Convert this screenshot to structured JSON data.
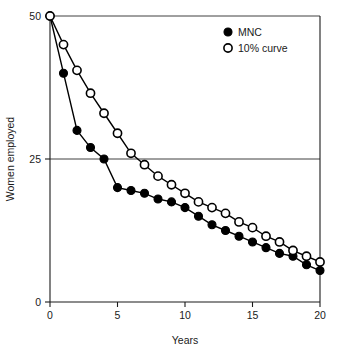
{
  "chart_data": {
    "type": "line",
    "title": "",
    "subtitle": "",
    "xlabel": "Years",
    "ylabel": "Women employed",
    "xlim": [
      0,
      20
    ],
    "ylim": [
      0,
      50
    ],
    "xticks": [
      0,
      5,
      10,
      15,
      20
    ],
    "yticks": [
      0,
      25,
      50
    ],
    "xtick_labels": [
      "0",
      "5",
      "10",
      "15",
      "20"
    ],
    "ytick_labels": [
      "0",
      "25",
      "50"
    ],
    "grid": "horizontal-at-25-and-50",
    "legend_position": "top-right",
    "x": [
      0,
      1,
      2,
      3,
      4,
      5,
      6,
      7,
      8,
      9,
      10,
      11,
      12,
      13,
      14,
      15,
      16,
      17,
      18,
      19,
      20
    ],
    "series": [
      {
        "name": "MNC",
        "marker": "filled-circle",
        "color": "#000000",
        "values": [
          50,
          40,
          30,
          27,
          25,
          20,
          19.5,
          19,
          18,
          17.5,
          16.5,
          15,
          13.5,
          12.5,
          11.5,
          10.5,
          9.5,
          8.5,
          8,
          6.5,
          5.5
        ]
      },
      {
        "name": "10% curve",
        "marker": "open-circle",
        "color": "#000000",
        "values": [
          50,
          45,
          40.5,
          36.5,
          33,
          29.5,
          26,
          24,
          22,
          20.5,
          19,
          17.5,
          16.5,
          15.5,
          14,
          13,
          11.5,
          10.5,
          9,
          8,
          7
        ]
      }
    ],
    "annotations": []
  },
  "legend": {
    "entries": [
      {
        "label": "MNC",
        "marker": "filled-circle"
      },
      {
        "label": "10% curve",
        "marker": "open-circle"
      }
    ]
  },
  "axes": {
    "x_title": "Years",
    "y_title": "Women employed"
  }
}
